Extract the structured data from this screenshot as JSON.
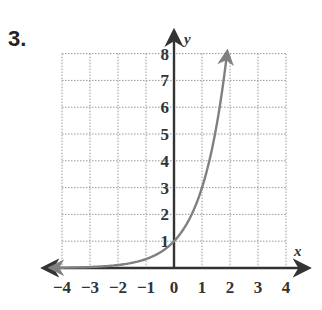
{
  "problem_number": "3.",
  "chart_data": {
    "type": "line",
    "title": "",
    "xlabel": "x",
    "ylabel": "y",
    "xlim": [
      -4,
      4
    ],
    "ylim": [
      0,
      8
    ],
    "grid": true,
    "grid_style": "dotted",
    "x_ticks": [
      "−4",
      "−3",
      "−2",
      "−1",
      "0",
      "1",
      "2",
      "3",
      "4"
    ],
    "y_ticks": [
      "1",
      "2",
      "3",
      "4",
      "5",
      "6",
      "7",
      "8"
    ],
    "series": [
      {
        "name": "y = 3^x",
        "color": "#808080",
        "x": [
          -4,
          -3,
          -2,
          -1,
          0,
          0.5,
          1,
          1.5,
          1.9
        ],
        "y": [
          0.012,
          0.037,
          0.111,
          0.333,
          1,
          1.732,
          3,
          5.196,
          8.06
        ],
        "left_arrow": true,
        "right_arrow": true
      }
    ]
  }
}
